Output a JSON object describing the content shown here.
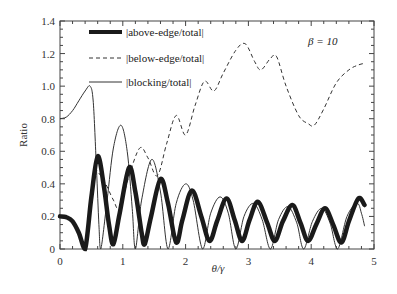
{
  "chart_data": {
    "type": "line",
    "title": "",
    "xlabel": "θ/γ",
    "ylabel": "Ratio",
    "xlim": [
      0,
      5
    ],
    "ylim": [
      0,
      1.4
    ],
    "x_ticks": [
      "0",
      "1",
      "2",
      "3",
      "4",
      "5"
    ],
    "y_ticks": [
      "0",
      "0.2",
      "0.4",
      "0.6",
      "0.8",
      "1.0",
      "1.2",
      "1.4"
    ],
    "grid": false,
    "legend_position": "upper-left",
    "annotations": [
      "β = 10"
    ],
    "series": [
      {
        "name": "|above-edge/total|",
        "style": "thick-solid",
        "points": [
          [
            0,
            0.2
          ],
          [
            0.1,
            0.195
          ],
          [
            0.2,
            0.17
          ],
          [
            0.3,
            0.1
          ],
          [
            0.4,
            0.0
          ],
          [
            0.5,
            0.32
          ],
          [
            0.6,
            0.57
          ],
          [
            0.7,
            0.38
          ],
          [
            0.78,
            0.15
          ],
          [
            0.85,
            0.03
          ],
          [
            0.95,
            0.22
          ],
          [
            1.1,
            0.5
          ],
          [
            1.2,
            0.35
          ],
          [
            1.3,
            0.1
          ],
          [
            1.35,
            0.03
          ],
          [
            1.45,
            0.2
          ],
          [
            1.6,
            0.43
          ],
          [
            1.72,
            0.28
          ],
          [
            1.85,
            0.04
          ],
          [
            1.95,
            0.18
          ],
          [
            2.1,
            0.36
          ],
          [
            2.25,
            0.2
          ],
          [
            2.38,
            0.05
          ],
          [
            2.5,
            0.17
          ],
          [
            2.65,
            0.31
          ],
          [
            2.78,
            0.18
          ],
          [
            2.9,
            0.05
          ],
          [
            3.02,
            0.18
          ],
          [
            3.15,
            0.29
          ],
          [
            3.3,
            0.16
          ],
          [
            3.42,
            0.05
          ],
          [
            3.55,
            0.17
          ],
          [
            3.7,
            0.27
          ],
          [
            3.83,
            0.16
          ],
          [
            3.95,
            0.05
          ],
          [
            4.08,
            0.15
          ],
          [
            4.22,
            0.25
          ],
          [
            4.35,
            0.15
          ],
          [
            4.48,
            0.04
          ],
          [
            4.6,
            0.17
          ],
          [
            4.75,
            0.31
          ],
          [
            4.85,
            0.27
          ]
        ]
      },
      {
        "name": "|below-edge/total|",
        "style": "dashed",
        "points": [
          [
            0.55,
            0.5
          ],
          [
            0.7,
            0.42
          ],
          [
            0.85,
            0.3
          ],
          [
            0.95,
            0.25
          ],
          [
            1.1,
            0.45
          ],
          [
            1.27,
            0.62
          ],
          [
            1.4,
            0.56
          ],
          [
            1.55,
            0.45
          ],
          [
            1.7,
            0.65
          ],
          [
            1.85,
            0.82
          ],
          [
            2.0,
            0.7
          ],
          [
            2.15,
            0.88
          ],
          [
            2.3,
            1.03
          ],
          [
            2.45,
            0.97
          ],
          [
            2.6,
            1.08
          ],
          [
            2.8,
            1.22
          ],
          [
            2.95,
            1.26
          ],
          [
            3.1,
            1.15
          ],
          [
            3.2,
            1.1
          ],
          [
            3.35,
            1.17
          ],
          [
            3.45,
            1.18
          ],
          [
            3.6,
            1.0
          ],
          [
            3.8,
            0.82
          ],
          [
            3.95,
            0.77
          ],
          [
            4.05,
            0.76
          ],
          [
            4.2,
            0.86
          ],
          [
            4.4,
            1.02
          ],
          [
            4.6,
            1.1
          ],
          [
            4.75,
            1.13
          ],
          [
            4.85,
            1.14
          ]
        ]
      },
      {
        "name": "|blocking/total|",
        "style": "thin-solid",
        "points": [
          [
            0,
            0.8
          ],
          [
            0.1,
            0.81
          ],
          [
            0.2,
            0.85
          ],
          [
            0.3,
            0.91
          ],
          [
            0.4,
            0.97
          ],
          [
            0.48,
            1.0
          ],
          [
            0.53,
            0.9
          ],
          [
            0.58,
            0.5
          ],
          [
            0.62,
            0.15
          ],
          [
            0.65,
            0.0
          ],
          [
            0.75,
            0.3
          ],
          [
            0.85,
            0.62
          ],
          [
            0.97,
            0.76
          ],
          [
            1.07,
            0.6
          ],
          [
            1.15,
            0.25
          ],
          [
            1.2,
            0.0
          ],
          [
            1.3,
            0.3
          ],
          [
            1.46,
            0.55
          ],
          [
            1.6,
            0.35
          ],
          [
            1.72,
            0.0
          ],
          [
            1.85,
            0.28
          ],
          [
            2.0,
            0.4
          ],
          [
            2.12,
            0.3
          ],
          [
            2.27,
            0.0
          ],
          [
            2.4,
            0.22
          ],
          [
            2.55,
            0.32
          ],
          [
            2.68,
            0.22
          ],
          [
            2.8,
            0.0
          ],
          [
            2.93,
            0.2
          ],
          [
            3.08,
            0.28
          ],
          [
            3.22,
            0.18
          ],
          [
            3.35,
            0.0
          ],
          [
            3.48,
            0.18
          ],
          [
            3.63,
            0.26
          ],
          [
            3.77,
            0.16
          ],
          [
            3.88,
            0.0
          ],
          [
            4.02,
            0.17
          ],
          [
            4.17,
            0.25
          ],
          [
            4.3,
            0.16
          ],
          [
            4.42,
            0.0
          ],
          [
            4.57,
            0.2
          ],
          [
            4.73,
            0.28
          ],
          [
            4.8,
            0.22
          ],
          [
            4.85,
            0.14
          ]
        ]
      }
    ]
  },
  "legend": {
    "items": [
      {
        "label": "|above-edge/total|"
      },
      {
        "label": "|below-edge/total|"
      },
      {
        "label": "|blocking/total|"
      }
    ]
  },
  "annotation": {
    "beta": "β = 10"
  }
}
